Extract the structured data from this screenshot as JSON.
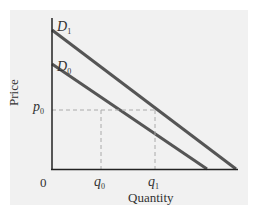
{
  "diagram": {
    "type": "demand-shift",
    "axes": {
      "x_label": "Quantity",
      "y_label": "Price",
      "origin_label": "0"
    },
    "curves": [
      {
        "name": "D0",
        "label_main": "D",
        "label_sub": "0"
      },
      {
        "name": "D1",
        "label_main": "D",
        "label_sub": "1"
      }
    ],
    "price_marker": {
      "label_main": "p",
      "label_sub": "0"
    },
    "quantity_markers": [
      {
        "label_main": "q",
        "label_sub": "0"
      },
      {
        "label_main": "q",
        "label_sub": "1"
      }
    ],
    "colors": {
      "background": "#f1f1f1",
      "curve": "#555555",
      "axis": "#222222",
      "guide": "#aaaaaa"
    }
  }
}
